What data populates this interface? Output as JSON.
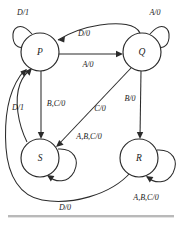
{
  "diagram": {
    "type": "finite-state-machine",
    "colors": {
      "background": "#ffffff",
      "stroke": "#2b2b2b",
      "text": "#1a1a1a",
      "rule": "#b9b9b9"
    },
    "states": [
      {
        "id": "P",
        "label": "P",
        "cx": 40,
        "cy": 52,
        "r": 19
      },
      {
        "id": "Q",
        "label": "Q",
        "cx": 142,
        "cy": 52,
        "r": 19
      },
      {
        "id": "S",
        "label": "S",
        "cx": 40,
        "cy": 158,
        "r": 19
      },
      {
        "id": "R",
        "label": "R",
        "cx": 139,
        "cy": 158,
        "r": 19
      }
    ],
    "transitions": [
      {
        "id": "p-self",
        "from": "P",
        "to": "P",
        "label": "D/1",
        "kind": "self-loop",
        "label_x": 23,
        "label_y": 12
      },
      {
        "id": "q-self",
        "from": "Q",
        "to": "Q",
        "label": "A/0",
        "kind": "self-loop",
        "label_x": 155,
        "label_y": 12
      },
      {
        "id": "q-to-p",
        "from": "Q",
        "to": "P",
        "label": "D/0",
        "kind": "curve",
        "label_x": 84,
        "label_y": 33
      },
      {
        "id": "p-to-q",
        "from": "P",
        "to": "Q",
        "label": "A/0",
        "kind": "straight",
        "label_x": 88,
        "label_y": 64
      },
      {
        "id": "p-to-s",
        "from": "P",
        "to": "S",
        "label": "B,C/0",
        "kind": "straight",
        "label_x": 56,
        "label_y": 103
      },
      {
        "id": "q-to-s",
        "from": "Q",
        "to": "S",
        "label": "C/0",
        "kind": "straight",
        "label_x": 100,
        "label_y": 108
      },
      {
        "id": "q-to-r",
        "from": "Q",
        "to": "R",
        "label": "B/0",
        "kind": "straight",
        "label_x": 130,
        "label_y": 98
      },
      {
        "id": "s-self",
        "from": "S",
        "to": "S",
        "label": "A,B,C/0",
        "kind": "self-loop",
        "label_x": 89,
        "label_y": 136
      },
      {
        "id": "r-self",
        "from": "R",
        "to": "R",
        "label": "A,B,C/0",
        "kind": "self-loop",
        "label_x": 146,
        "label_y": 197
      },
      {
        "id": "s-to-p",
        "from": "S",
        "to": "P",
        "label": "D/1",
        "kind": "curve",
        "label_x": 18,
        "label_y": 107
      },
      {
        "id": "r-to-p",
        "from": "R",
        "to": "P",
        "label": "D/0",
        "kind": "curve",
        "label_x": 65,
        "label_y": 207
      }
    ]
  }
}
